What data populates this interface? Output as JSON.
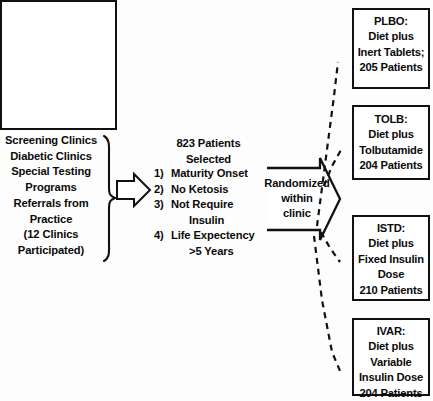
{
  "diagram": {
    "colors": {
      "ink": "#111111",
      "background": "#fdfdfd",
      "box_fill": "#ffffff"
    },
    "source": {
      "label": "Screening Clinics\nDiabetic Clinics\nSpecial Testing\nPrograms\nReferrals from\nPractice\n(12 Clinics\nParticipated)",
      "lines": [
        "Screening Clinics",
        "Diabetic Clinics",
        "Special Testing",
        "Programs",
        "Referrals from",
        "Practice",
        "(12 Clinics",
        "Participated)"
      ]
    },
    "selection": {
      "heading": "823 Patients\nSelected",
      "patients_selected": 823,
      "criteria": [
        {
          "number": "1)",
          "text": "Maturity Onset",
          "continuation": ""
        },
        {
          "number": "2)",
          "text": "No Ketosis",
          "continuation": ""
        },
        {
          "number": "3)",
          "text": "Not Require",
          "continuation": "Insulin"
        },
        {
          "number": "4)",
          "text": "Life Expectency",
          "continuation": ">5 Years"
        }
      ]
    },
    "randomization": {
      "label": "Randomized\nwithin\nclinic"
    },
    "arms": [
      {
        "id": "plbo",
        "code": "PLBO:",
        "description": "Diet plus\nInert Tablets;",
        "patients": "205 Patients",
        "text": "PLBO:\nDiet plus\nInert Tablets;\n205 Patients"
      },
      {
        "id": "tolb",
        "code": "TOLB:",
        "description": "Diet plus\nTolbutamide",
        "patients": "204 Patients",
        "text": "TOLB:\nDiet plus\nTolbutamide\n204 Patients"
      },
      {
        "id": "istd",
        "code": "ISTD:",
        "description": "Diet plus\nFixed Insulin\nDose",
        "patients": "210 Patients",
        "text": "ISTD:\nDiet plus\nFixed Insulin\nDose\n210 Patients"
      },
      {
        "id": "ivar",
        "code": "IVAR:",
        "description": "Diet plus\nVariable\nInsulin Dose",
        "patients": "204 Patients",
        "text": "IVAR:\nDiet plus\nVariable\nInsulin Dose\n204 Patients"
      }
    ],
    "connectors": {
      "intake_arrow": "open-block-arrow-right",
      "randomize_arrow": "block-arrow-right",
      "brace": "right-curly-brace",
      "arm_links": "dashed-lines"
    }
  }
}
